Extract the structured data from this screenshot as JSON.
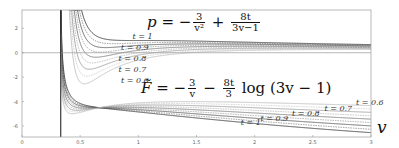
{
  "chart_data": {
    "type": "line",
    "title": "",
    "xlabel": "v",
    "ylabel": "",
    "xlim": [
      0,
      3
    ],
    "ylim": [
      -6.9,
      3.5
    ],
    "grid": false,
    "x_ticks": [
      "0",
      "0.5",
      "1",
      "1.5",
      "2",
      "2.5",
      "3"
    ],
    "x_tick_values": [
      0,
      0.5,
      1,
      1.5,
      2,
      2.5,
      3
    ],
    "y_ticks": [
      "2",
      "0",
      "-2",
      "-4",
      "-6"
    ],
    "y_tick_values": [
      2,
      0,
      -2,
      -4,
      -6
    ],
    "horizontal_line_at": 0,
    "vertical_asymptote_v": 0.3333,
    "annotations": {
      "pressure_equation": {
        "lhs": "p",
        "minus_num": "3",
        "minus_den": "v²",
        "plus_num": "8t",
        "plus_den": "3v−1"
      },
      "free_energy_equation": {
        "lhs": "F̃",
        "minus_num": "3",
        "minus_den": "v",
        "minus2_num": "8t",
        "minus2_den": "3",
        "tail": "log (3v − 1)"
      }
    },
    "series": [
      {
        "name": "p, t = 1",
        "family": "pressure",
        "t": 1.0,
        "label": "t = 1",
        "label_pos": [
          0.95,
          1.1
        ]
      },
      {
        "name": "p, t = 0.9",
        "family": "pressure",
        "t": 0.9,
        "label": "t = 0.9",
        "label_pos": [
          0.85,
          0.2
        ]
      },
      {
        "name": "p, t = 0.8",
        "family": "pressure",
        "t": 0.8,
        "label": "t = 0.8",
        "label_pos": [
          0.83,
          -0.65
        ]
      },
      {
        "name": "p, t = 0.7",
        "family": "pressure",
        "t": 0.7,
        "label": "t = 0.7",
        "label_pos": [
          0.83,
          -1.6
        ]
      },
      {
        "name": "p, t = 0.6",
        "family": "pressure",
        "t": 0.6,
        "label": "t = 0.6",
        "label_pos": [
          0.85,
          -2.5
        ]
      },
      {
        "name": "F, t = 1",
        "family": "free_energy",
        "t": 1.0,
        "label": "t = 1",
        "label_pos": [
          1.88,
          -5.95
        ]
      },
      {
        "name": "F, t = 0.9",
        "family": "free_energy",
        "t": 0.9,
        "label": "t = 0.9",
        "label_pos": [
          2.05,
          -5.6
        ]
      },
      {
        "name": "F, t = 0.8",
        "family": "free_energy",
        "t": 0.8,
        "label": "t = 0.8",
        "label_pos": [
          2.32,
          -5.15
        ]
      },
      {
        "name": "F, t = 0.7",
        "family": "free_energy",
        "t": 0.7,
        "label": "t = 0.7",
        "label_pos": [
          2.6,
          -4.75
        ]
      },
      {
        "name": "F, t = 0.6",
        "family": "free_energy",
        "t": 0.6,
        "label": "t = 0.6",
        "label_pos": [
          2.87,
          -4.3
        ]
      }
    ],
    "extra_dashed_t": [
      0.95,
      0.85,
      0.75,
      0.65
    ],
    "colors": {
      "frame": "#9a9a9a",
      "darkest": "#222222",
      "lightest": "#b8b8b8"
    }
  },
  "xlabel_text": "v"
}
